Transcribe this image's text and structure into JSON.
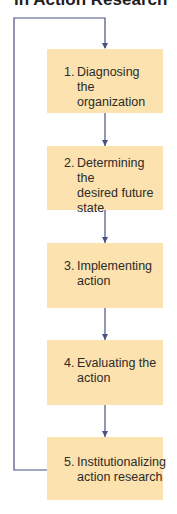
{
  "title": "in Action Research",
  "colors": {
    "box_fill": "#fbe2ae",
    "connector": "#4a5082",
    "text": "#2b2b2b",
    "title_text": "#1e1e1e"
  },
  "steps": [
    {
      "number": "1.",
      "label": "Diagnosing the\norganization"
    },
    {
      "number": "2.",
      "label": "Determining the\ndesired future\nstate"
    },
    {
      "number": "3.",
      "label": "Implementing\naction"
    },
    {
      "number": "4.",
      "label": "Evaluating the\naction"
    },
    {
      "number": "5.",
      "label": "Institutionalizing\naction research"
    }
  ],
  "connectors": {
    "sequential_arrows": [
      "1→2",
      "2→3",
      "3→4",
      "4→5"
    ],
    "feedback_loop": "5→1"
  }
}
